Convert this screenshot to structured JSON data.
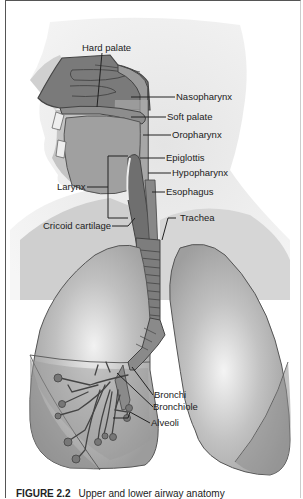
{
  "figure": {
    "caption_label": "FIGURE 2.2",
    "caption_text": "Upper and lower airway anatomy"
  },
  "labels": {
    "hard_palate": "Hard palate",
    "nasopharynx": "Nasopharynx",
    "soft_palate": "Soft palate",
    "oropharynx": "Oropharynx",
    "epiglottis": "Epiglottis",
    "hypopharynx": "Hypopharynx",
    "larynx": "Larynx",
    "esophagus": "Esophagus",
    "trachea": "Trachea",
    "cricoid_cartilage": "Cricoid cartilage",
    "bronchi": "Bronchi",
    "bronchiole": "Bronchiole",
    "alveoli": "Alveoli"
  },
  "colors": {
    "skin": "#d9d9d9",
    "tissue": "#8f8f8f",
    "dark_tissue": "#6e6e6e",
    "lung": "#a8a8a8",
    "outline": "#444444"
  }
}
